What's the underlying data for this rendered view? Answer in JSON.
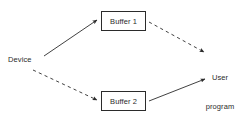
{
  "diagram": {
    "background_color": "#ffffff",
    "stroke_color": "#2b2b2b",
    "text_color": "#2b2b2b",
    "width": 243,
    "height": 120,
    "nodes": {
      "device": {
        "label": "Device",
        "shape": "text",
        "x": 8,
        "y": 55
      },
      "buffer_1": {
        "label": "Buffer 1",
        "shape": "rectangle",
        "x": 101,
        "y": 11,
        "width": 45,
        "height": 20
      },
      "buffer_2": {
        "label": "Buffer 2",
        "shape": "rectangle",
        "x": 101,
        "y": 91,
        "width": 45,
        "height": 20
      },
      "user_program": {
        "label_line_1": "User",
        "label_line_2": "program",
        "shape": "text",
        "x": 198,
        "y": 54
      }
    },
    "edges": [
      {
        "name": "device-to-buffer-1",
        "from": "device",
        "to": "buffer_1",
        "style": "solid",
        "arrowhead": "filled",
        "x1": 44,
        "y1": 56,
        "x2": 98,
        "y2": 20
      },
      {
        "name": "buffer-1-to-user-program",
        "from": "buffer_1",
        "to": "user_program",
        "style": "dashed",
        "arrowhead": "filled",
        "x1": 149,
        "y1": 22,
        "x2": 205,
        "y2": 52
      },
      {
        "name": "device-to-buffer-2",
        "from": "device",
        "to": "buffer_2",
        "style": "dashed",
        "arrowhead": "filled",
        "x1": 33,
        "y1": 70,
        "x2": 98,
        "y2": 100
      },
      {
        "name": "buffer-2-to-user-program",
        "from": "buffer_2",
        "to": "user_program",
        "style": "solid",
        "arrowhead": "filled",
        "x1": 149,
        "y1": 101,
        "x2": 206,
        "y2": 78
      }
    ]
  }
}
